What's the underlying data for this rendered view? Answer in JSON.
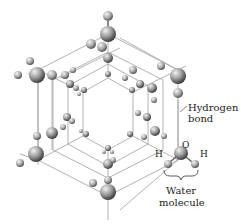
{
  "figure": {
    "labels": {
      "hydrogen_bond_line1": "Hydrogen",
      "hydrogen_bond_line2": "bond",
      "oxygen": "O",
      "hydrogen_left": "H",
      "hydrogen_right": "H",
      "water_line1": "Water",
      "water_line2": "molecule"
    },
    "colors": {
      "atom_light": "#e8e8e8",
      "atom_dark": "#5a5a5a",
      "bond_line": "#9a9a9a",
      "text": "#222222",
      "background": "#ffffff"
    }
  }
}
